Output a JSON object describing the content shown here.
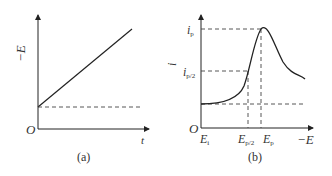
{
  "figure": {
    "panel_a": {
      "caption": "(a)",
      "y_axis_label": "−E",
      "x_axis_label": "t",
      "origin_label": "O",
      "description": "Linear potential sweep: −E increases linearly with time from initial potential"
    },
    "panel_b": {
      "caption": "(b)",
      "y_axis_label": "i",
      "x_axis_label": "−E",
      "origin_label": "O",
      "y_ticks": [
        {
          "main": "i",
          "sub": "p"
        },
        {
          "main": "i",
          "sub": "p/2"
        }
      ],
      "x_ticks": [
        {
          "main": "E",
          "sub": "i"
        },
        {
          "main": "E",
          "sub": "p/2"
        },
        {
          "main": "E",
          "sub": "p"
        }
      ],
      "description": "Linear sweep voltammogram with peak current i_p at peak potential E_p, half-peak at E_p/2"
    }
  },
  "colors": {
    "line": "#222222",
    "dashed": "#444444",
    "text": "#333333"
  }
}
